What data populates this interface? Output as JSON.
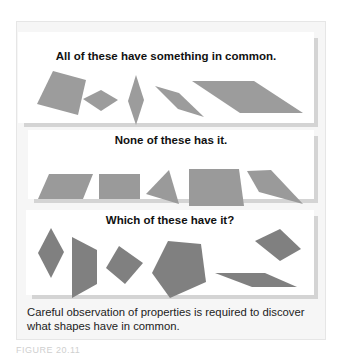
{
  "panels": [
    {
      "title": "All of these have something in common.",
      "fill": "#9c9c9c",
      "shapes": [
        {
          "name": "tilted-square",
          "points": "35,49 68,58 60,93 19,82"
        },
        {
          "name": "small-rhombus",
          "points": "83,76 101,67 118,78 100,89"
        },
        {
          "name": "tall-rhombus",
          "points": "135,53 142,80 135,103 127,79"
        },
        {
          "name": "rhombus",
          "points": "154,64 180,72 203,95 177,87"
        },
        {
          "name": "long-parallelogram",
          "points": "191,59 253,59 302,91 239,91"
        }
      ]
    },
    {
      "title": "None of these has it.",
      "fill": "#9a9a9a",
      "shapes": [
        {
          "name": "parallelogram",
          "points": "22,44 92,44 82,69 12,69"
        },
        {
          "name": "rectangle",
          "points": "98,44 139,44 139,69 98,69"
        },
        {
          "name": "triangle",
          "points": "168,40 178,74 145,64"
        },
        {
          "name": "trapezoid",
          "points": "195,39 238,39 243,76 188,76"
        },
        {
          "name": "quadrilateral",
          "points": "246,41 270,40 302,74 258,62"
        }
      ]
    },
    {
      "title": "Which of these have it?",
      "fill": "#808080",
      "shapes": [
        {
          "name": "rhombus-vertical",
          "points": "50,18 63,42 50,68 37,43"
        },
        {
          "name": "quadrilateral-tall",
          "points": "71,27 96,40 96,74 71,88"
        },
        {
          "name": "square-tilted",
          "points": "118,36 142,53 124,74 105,58"
        },
        {
          "name": "pentagon",
          "points": "167,31 200,34 205,72 169,88 151,63"
        },
        {
          "name": "rhombus-small",
          "points": "279,19 300,39 279,51 254,31"
        },
        {
          "name": "flat-parallelogram",
          "points": "214,63 264,63 296,77 251,77"
        }
      ]
    }
  ],
  "caption": {
    "line1": "Careful observation of properties is required to discover",
    "line2": "what shapes have in common."
  },
  "figure_label": "FIGURE 20.11"
}
